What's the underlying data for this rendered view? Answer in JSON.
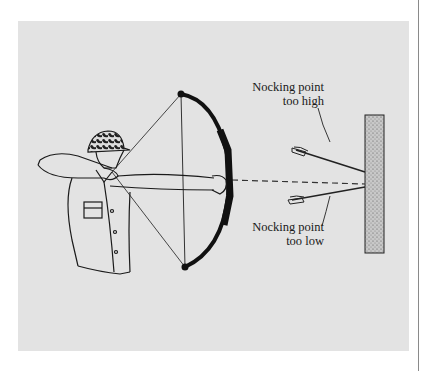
{
  "figure": {
    "labels": {
      "high": {
        "line1": "Nocking point",
        "line2": "too high"
      },
      "low": {
        "line1": "Nocking point",
        "line2": "too low"
      }
    },
    "colors": {
      "page": "#ffffff",
      "panel": "#e3e3e3",
      "ink": "#1a1a1a",
      "target_fill": "#bdbdbd",
      "rule": "#8a8a8a"
    }
  }
}
